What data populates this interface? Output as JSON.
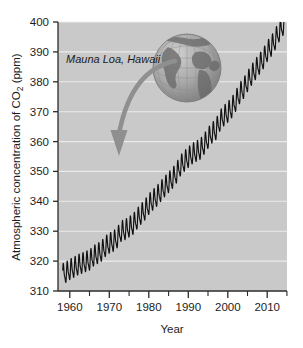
{
  "figure": {
    "background_color": "#ffffff",
    "plot_background_color": "#c9c9c9",
    "gridline_color": "#ebebeb",
    "axis_color": "#2b2b2b",
    "series_color": "#111111"
  },
  "annotation": {
    "location_label": "Mauna Loa, Hawaii",
    "arrow_color": "#8f8f8f",
    "globe_name": "globe-graphic"
  },
  "axes": {
    "y_title_prefix": "Atmospheric concentration of CO",
    "y_title_subscript": "2",
    "y_title_suffix": " (ppm)",
    "x_title": "Year",
    "y_ticks": [
      "310",
      "320",
      "330",
      "340",
      "350",
      "360",
      "370",
      "380",
      "390",
      "400"
    ],
    "x_ticks": [
      "1960",
      "1970",
      "1980",
      "1990",
      "2000",
      "2010"
    ]
  },
  "chart_data": {
    "type": "line",
    "title": "",
    "subtitle": "",
    "xlabel": "Year",
    "ylabel": "Atmospheric concentration of CO2 (ppm)",
    "xlim": [
      1957,
      2015
    ],
    "ylim": [
      310,
      400
    ],
    "ytick_values": [
      310,
      320,
      330,
      340,
      350,
      360,
      370,
      380,
      390,
      400
    ],
    "xtick_values": [
      1960,
      1970,
      1980,
      1990,
      2000,
      2010
    ],
    "xtick_minor_values": [
      1965,
      1975,
      1985,
      1995,
      2005
    ],
    "grid": "horizontal",
    "legend": "none",
    "annotations": [
      {
        "text": "Mauna Loa, Hawaii",
        "x": 1963,
        "y": 385,
        "style": "italic"
      },
      {
        "type": "curved-arrow",
        "from_x": 1978,
        "from_y": 383,
        "to_x": 1970,
        "to_y": 356,
        "color": "#8f8f8f"
      },
      {
        "type": "image",
        "name": "globe-graphic",
        "center_x": 1983,
        "center_y": 382
      }
    ],
    "seasonal_amplitude_ppm": 6,
    "series": [
      {
        "name": "Monthly mean CO2 (annual mean trend)",
        "x": [
          1958,
          1959,
          1960,
          1961,
          1962,
          1963,
          1964,
          1965,
          1966,
          1967,
          1968,
          1969,
          1970,
          1971,
          1972,
          1973,
          1974,
          1975,
          1976,
          1977,
          1978,
          1979,
          1980,
          1981,
          1982,
          1983,
          1984,
          1985,
          1986,
          1987,
          1988,
          1989,
          1990,
          1991,
          1992,
          1993,
          1994,
          1995,
          1996,
          1997,
          1998,
          1999,
          2000,
          2001,
          2002,
          2003,
          2004,
          2005,
          2006,
          2007,
          2008,
          2009,
          2010,
          2011,
          2012,
          2013,
          2014
        ],
        "values": [
          315.3,
          315.9,
          316.9,
          317.6,
          318.4,
          318.9,
          319.5,
          320.0,
          321.4,
          322.2,
          323.0,
          324.6,
          325.7,
          326.3,
          327.5,
          329.7,
          330.2,
          331.1,
          332.0,
          333.8,
          335.4,
          336.8,
          338.7,
          340.1,
          341.4,
          343.0,
          344.6,
          346.0,
          347.4,
          349.2,
          351.6,
          353.1,
          354.4,
          355.6,
          356.4,
          357.1,
          358.8,
          360.8,
          362.6,
          363.7,
          366.6,
          368.3,
          369.5,
          371.0,
          373.2,
          375.8,
          377.5,
          379.8,
          381.9,
          383.8,
          385.6,
          387.4,
          389.9,
          391.6,
          393.8,
          396.5,
          398.6
        ]
      }
    ]
  }
}
